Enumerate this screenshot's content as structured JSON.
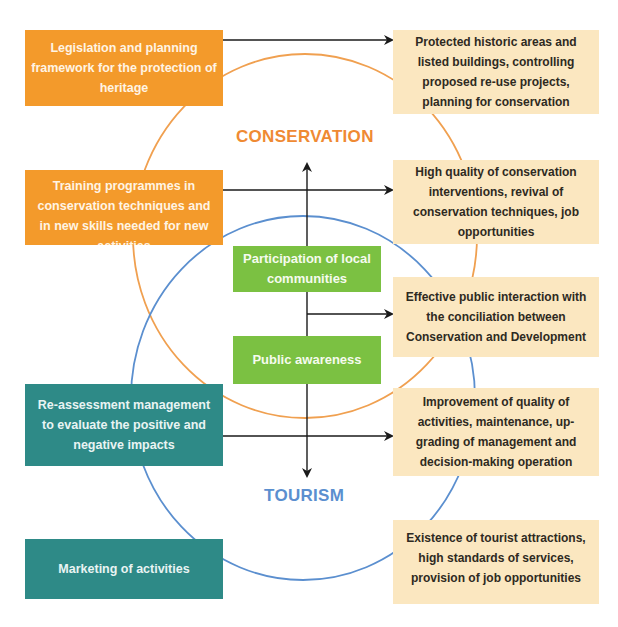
{
  "colors": {
    "inputs_conservation": "#f39a2b",
    "inputs_tourism": "#2e8a87",
    "center": "#7bc142",
    "outcomes": "#fbe7c0",
    "conservation_circle": "#f0a050",
    "tourism_circle": "#5b8fcf",
    "arrow": "#1a1a1a"
  },
  "circles": {
    "conservation": {
      "label": "CONSERVATION"
    },
    "tourism": {
      "label": "TOURISM"
    }
  },
  "inputs": [
    {
      "id": "legislation",
      "text": "Legislation and planning framework for the protection of heritage"
    },
    {
      "id": "training",
      "text": "Training programmes in conservation techniques and in new skills needed for new activities"
    },
    {
      "id": "reassessment",
      "text": "Re-assessment management to evaluate the positive and negative impacts"
    },
    {
      "id": "marketing",
      "text": "Marketing of activities"
    }
  ],
  "center": [
    {
      "id": "participation",
      "text": "Participation of local communities"
    },
    {
      "id": "awareness",
      "text": "Public awareness"
    }
  ],
  "outcomes": [
    {
      "id": "protected-areas",
      "text": "Protected historic areas and listed buildings, controlling proposed re-use projects, planning for conservation"
    },
    {
      "id": "high-quality",
      "text": "High quality of conservation interventions, revival of conservation techniques, job opportunities"
    },
    {
      "id": "public-interaction",
      "text": "Effective public interaction with the conciliation between Conservation and Development"
    },
    {
      "id": "improvement",
      "text": "Improvement of quality of activities, maintenance, up-grading of management and decision-making operation"
    },
    {
      "id": "tourist-attractions",
      "text": "Existence of tourist attractions, high standards of services, provision of job opportunities"
    }
  ]
}
